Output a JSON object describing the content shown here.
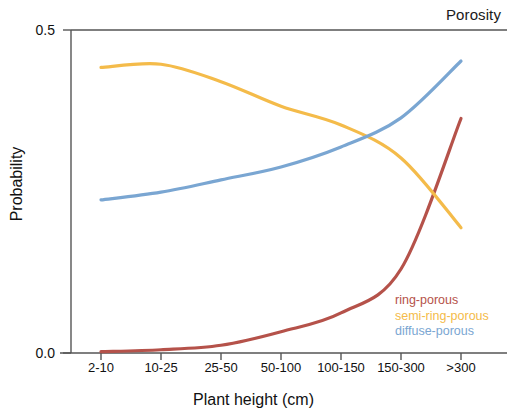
{
  "chart_data": {
    "type": "line",
    "title": "Porosity",
    "xlabel": "Plant height (cm)",
    "ylabel": "Probability",
    "categories": [
      "2-10",
      "10-25",
      "25-50",
      "50-100",
      "100-150",
      "150-300",
      ">300"
    ],
    "ylim": [
      0.0,
      0.5
    ],
    "ytick_labels": [
      "0.0",
      "0.5"
    ],
    "ytick_values": [
      0.0,
      0.5
    ],
    "grid": false,
    "legend_position": "inside bottom-right",
    "series": [
      {
        "name": "ring-porous",
        "color": "#b5524a",
        "values": [
          0.002,
          0.005,
          0.012,
          0.033,
          0.062,
          0.13,
          0.363
        ]
      },
      {
        "name": "semi-ring-porous",
        "color": "#f4bb4a",
        "values": [
          0.442,
          0.447,
          0.42,
          0.382,
          0.353,
          0.302,
          0.194
        ]
      },
      {
        "name": "diffuse-porous",
        "color": "#7aa6d2",
        "values": [
          0.237,
          0.249,
          0.268,
          0.288,
          0.319,
          0.364,
          0.452
        ]
      }
    ]
  },
  "axes": {
    "frame_color": "#555555"
  }
}
